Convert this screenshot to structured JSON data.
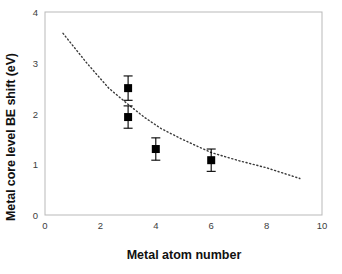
{
  "chart_data": {
    "type": "scatter",
    "title": "",
    "xlabel": "Metal atom number",
    "ylabel": "Metal core level BE shift (eV)",
    "xlim": [
      0,
      10
    ],
    "ylim": [
      0,
      4
    ],
    "xticks": [
      "0",
      "2",
      "4",
      "6",
      "8",
      "10"
    ],
    "xtick_values": [
      0,
      2,
      4,
      6,
      8,
      10
    ],
    "yticks": [
      "0",
      "1",
      "2",
      "3",
      "4"
    ],
    "ytick_values": [
      0,
      1,
      2,
      3,
      4
    ],
    "grid": false,
    "legend": "none",
    "marker": "filled-square",
    "marker_color": "#000000",
    "errorbar_color": "#000000",
    "series": [
      {
        "name": "Metal core level BE shift",
        "x": [
          3,
          3,
          4,
          6
        ],
        "y": [
          2.5,
          1.93,
          1.3,
          1.08
        ],
        "yerr": [
          0.24,
          0.22,
          0.22,
          0.22
        ]
      }
    ],
    "trendline": {
      "name": "fit",
      "style": "dotted",
      "color": "#3a3a3a",
      "x_start": 0.65,
      "y_start": 3.58,
      "x_end": 9.2,
      "y_end": 0.72,
      "x": [
        0.65,
        1.5,
        2.3,
        3.0,
        3.6,
        4.2,
        5.0,
        6.0,
        7.0,
        8.0,
        9.2
      ],
      "y": [
        3.58,
        3.0,
        2.5,
        2.18,
        1.92,
        1.7,
        1.48,
        1.23,
        1.07,
        0.93,
        0.72
      ]
    }
  }
}
